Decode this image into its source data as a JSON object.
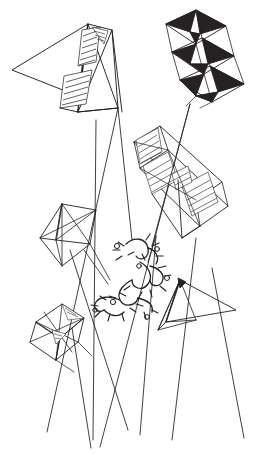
{
  "artwork": {
    "title": "Kites in Flight",
    "medium": "pen and ink line drawing",
    "background_color": "#ffffff",
    "ink_color": "#231f20",
    "fill_dark_color": "#262223",
    "canvas": {
      "width": 264,
      "height": 455
    }
  },
  "subjects": [
    {
      "id": "kite-top-left",
      "name": "delta-box-kite-top-left",
      "type": "delta box kite",
      "shading": "diagonal hatching",
      "position": {
        "x": 10,
        "y": 12,
        "width": 115,
        "height": 115
      }
    },
    {
      "id": "kite-top-right",
      "name": "stacked-diamond-kite-top-right",
      "type": "stacked diamond cellular kite",
      "shading": "solid dark triangles",
      "cells": 3,
      "position": {
        "x": 160,
        "y": 4,
        "width": 95,
        "height": 110
      }
    },
    {
      "id": "kite-middle",
      "name": "box-kite-middle",
      "type": "rectangular box kite",
      "shading": "diagonal hatching",
      "position": {
        "x": 128,
        "y": 124,
        "width": 105,
        "height": 115
      }
    },
    {
      "id": "kite-mid-left",
      "name": "diamond-kite-mid-left",
      "type": "pyramid diamond kite",
      "shading": "open outline",
      "position": {
        "x": 36,
        "y": 200,
        "width": 75,
        "height": 80
      }
    },
    {
      "id": "kite-bottom-left",
      "name": "cellular-kite-bottom-left",
      "type": "cellular diamond kite",
      "shading": "light hatching",
      "position": {
        "x": 26,
        "y": 300,
        "width": 75,
        "height": 75
      }
    },
    {
      "id": "kite-right",
      "name": "delta-kite-right",
      "type": "delta triangle kite",
      "shading": "open outline",
      "position": {
        "x": 156,
        "y": 270,
        "width": 80,
        "height": 65
      }
    }
  ],
  "tangle": {
    "name": "tangled-strings-knot",
    "description": "cluster of knotted and snarled kite lines",
    "position": {
      "x": 90,
      "y": 232,
      "width": 80,
      "height": 80
    }
  },
  "tethers": {
    "name": "kite-lines",
    "count": 7,
    "description": "long taut strings descending toward the lower edge"
  }
}
